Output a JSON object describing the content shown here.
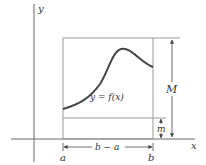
{
  "figure": {
    "axis_labels": {
      "x": "x",
      "y": "y"
    },
    "curve_label": "y = f(x)",
    "interval_labels": {
      "a": "a",
      "b": "b",
      "width": "b − a"
    },
    "bound_labels": {
      "upper": "M",
      "lower": "m"
    },
    "colors": {
      "axis": "#555555",
      "rectangle": "#888888",
      "curve": "#444444",
      "dimension": "#444444",
      "text": "#333333"
    }
  }
}
